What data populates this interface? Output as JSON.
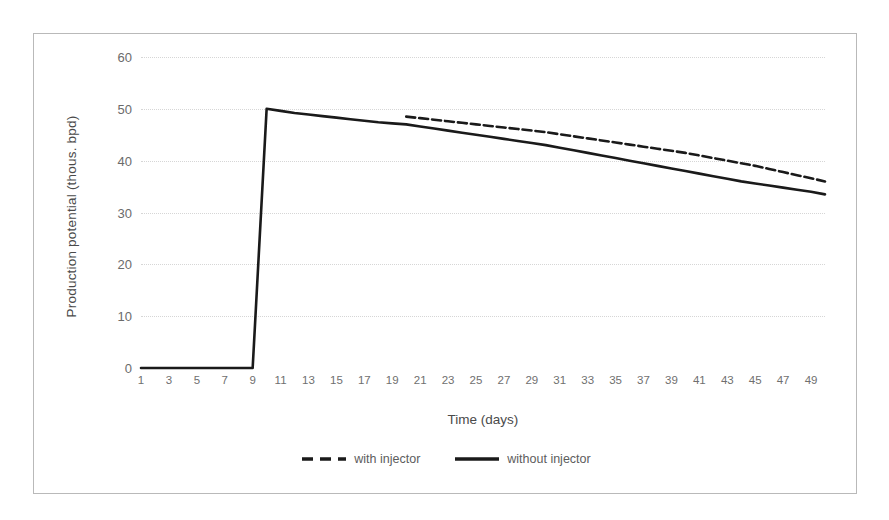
{
  "chart_data": {
    "type": "line",
    "title": "",
    "xlabel": "Time (days)",
    "ylabel": "Production potential (thous. bpd)",
    "xlim": [
      1,
      50
    ],
    "ylim": [
      0,
      60
    ],
    "ytick_step": 10,
    "xtick_step": 2,
    "grid": true,
    "legend_position": "bottom",
    "yticks": [
      0,
      10,
      20,
      30,
      40,
      50,
      60
    ],
    "xticks": [
      1,
      3,
      5,
      7,
      9,
      11,
      13,
      15,
      17,
      19,
      21,
      23,
      25,
      27,
      29,
      31,
      33,
      35,
      37,
      39,
      41,
      43,
      45,
      47,
      49
    ],
    "x": [
      1,
      2,
      3,
      4,
      5,
      6,
      7,
      8,
      9,
      10,
      11,
      12,
      13,
      14,
      15,
      16,
      17,
      18,
      19,
      20,
      21,
      22,
      23,
      24,
      25,
      26,
      27,
      28,
      29,
      30,
      31,
      32,
      33,
      34,
      35,
      36,
      37,
      38,
      39,
      40,
      41,
      42,
      43,
      44,
      45,
      46,
      47,
      48,
      49,
      50
    ],
    "series": [
      {
        "name": "without injector",
        "style": "solid",
        "color": "#1a1a1a",
        "values": [
          0,
          0,
          0,
          0,
          0,
          0,
          0,
          0,
          0,
          50.0,
          49.6,
          49.2,
          48.9,
          48.6,
          48.3,
          48.0,
          47.7,
          47.4,
          47.2,
          47.0,
          46.6,
          46.2,
          45.8,
          45.4,
          45.0,
          44.6,
          44.2,
          43.8,
          43.4,
          43.0,
          42.5,
          42.0,
          41.5,
          41.0,
          40.5,
          40.0,
          39.5,
          39.0,
          38.5,
          38.0,
          37.5,
          37.0,
          36.5,
          36.0,
          35.6,
          35.2,
          34.8,
          34.4,
          34.0,
          33.5
        ]
      },
      {
        "name": "with injector",
        "style": "dashed",
        "color": "#1a1a1a",
        "values": [
          null,
          null,
          null,
          null,
          null,
          null,
          null,
          null,
          null,
          null,
          null,
          null,
          null,
          null,
          null,
          null,
          null,
          null,
          null,
          48.5,
          48.2,
          47.9,
          47.6,
          47.3,
          47.0,
          46.7,
          46.4,
          46.1,
          45.8,
          45.5,
          45.1,
          44.7,
          44.3,
          43.9,
          43.5,
          43.1,
          42.7,
          42.3,
          41.9,
          41.5,
          41.0,
          40.5,
          40.0,
          39.5,
          39.0,
          38.4,
          37.8,
          37.2,
          36.6,
          36.0
        ]
      }
    ],
    "annotations": [
      "Production ramps from 0 to 50 thous. bpd at day 10",
      "Curves separate at day 20 where the with-injector case steps up"
    ]
  },
  "legend": {
    "items": [
      {
        "label": "with injector",
        "marker": "dashed-line-swatch"
      },
      {
        "label": "without injector",
        "marker": "solid-line-swatch"
      }
    ]
  },
  "colors": {
    "line": "#1a1a1a",
    "grid": "#d6d6d6",
    "frame_border": "#b9b9b9",
    "axis_text": "#6b6b6b",
    "title_text": "#4a4a4a",
    "background": "#ffffff"
  }
}
